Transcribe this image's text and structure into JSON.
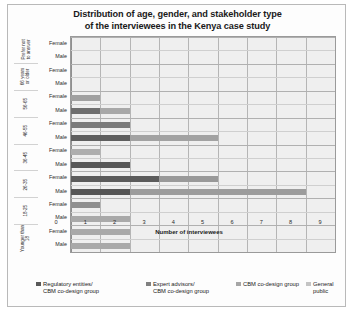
{
  "chart_data": {
    "type": "bar",
    "orientation": "horizontal",
    "stacked": true,
    "title": "Distribution of age, gender, and stakeholder type of the interviewees in the Kenya case study",
    "title_line1": "Distribution of age, gender, and stakeholder type",
    "title_line2": "of the interviewees in the Kenya case study",
    "xlabel": "Number of interviewees",
    "ylabel": "",
    "xlim": [
      0,
      9
    ],
    "xticks": [
      0,
      1,
      2,
      3,
      4,
      5,
      6,
      7,
      8,
      9
    ],
    "xtick_labels": [
      "0",
      "1",
      "2",
      "3",
      "4",
      "5",
      "6",
      "7",
      "8",
      "9"
    ],
    "grid": true,
    "legend_position": "bottom",
    "age_groups": [
      "Prefer not to answer",
      "66 years or older",
      "56-65",
      "46-55",
      "36-45",
      "26-35",
      "18-25",
      "Younger than 18"
    ],
    "genders": [
      "Female",
      "Male"
    ],
    "series": [
      {
        "name": "Regulatory entities/\nCBM co-design group",
        "color": "#595959",
        "values": [
          0,
          0,
          0,
          0,
          1,
          1,
          2,
          2,
          1,
          2,
          3,
          2,
          1,
          0,
          0,
          0
        ]
      },
      {
        "name": "Expert advisors/\nCBM co-design group",
        "color": "#a6a6a6",
        "values": [
          0,
          0,
          0,
          0,
          0,
          0,
          0,
          0,
          0,
          0,
          0,
          0,
          0,
          2,
          2,
          2
        ]
      },
      {
        "name": "CBM co-design group",
        "color": "#8c8c8c",
        "values": [
          0,
          0,
          0,
          0,
          0,
          0,
          0,
          3,
          2,
          6,
          0,
          0,
          0,
          0,
          0,
          0
        ]
      },
      {
        "name": "General public",
        "color": "#bfbfbf",
        "values": [
          0,
          0,
          0,
          0,
          0,
          0,
          0,
          0,
          0,
          0,
          0,
          0,
          0,
          0,
          0,
          0
        ]
      }
    ],
    "rows": [
      {
        "age": "Prefer not to answer",
        "gender": "Female",
        "segments": []
      },
      {
        "age": "Prefer not to answer",
        "gender": "Male",
        "segments": []
      },
      {
        "age": "66 years or older",
        "gender": "Female",
        "segments": []
      },
      {
        "age": "66 years or older",
        "gender": "Male",
        "segments": []
      },
      {
        "age": "56-65",
        "gender": "Female",
        "segments": [
          {
            "series": 0,
            "value": 1,
            "color": "#a0a0a0"
          }
        ]
      },
      {
        "age": "56-65",
        "gender": "Male",
        "segments": [
          {
            "series": 0,
            "value": 1,
            "color": "#6e6e6e"
          },
          {
            "series": 2,
            "value": 1,
            "color": "#a8a8a8"
          }
        ]
      },
      {
        "age": "46-55",
        "gender": "Female",
        "segments": [
          {
            "series": 0,
            "value": 2,
            "color": "#7a7a7a"
          }
        ]
      },
      {
        "age": "46-55",
        "gender": "Male",
        "segments": [
          {
            "series": 0,
            "value": 2,
            "color": "#5f5f5f"
          },
          {
            "series": 2,
            "value": 3,
            "color": "#a2a2a2"
          }
        ]
      },
      {
        "age": "36-45",
        "gender": "Female",
        "segments": [
          {
            "series": 0,
            "value": 1,
            "color": "#aeaeae"
          }
        ]
      },
      {
        "age": "36-45",
        "gender": "Male",
        "segments": [
          {
            "series": 0,
            "value": 2,
            "color": "#585858"
          }
        ]
      },
      {
        "age": "26-35",
        "gender": "Female",
        "segments": [
          {
            "series": 0,
            "value": 3,
            "color": "#5b5b5b"
          },
          {
            "series": 2,
            "value": 2,
            "color": "#999999"
          }
        ]
      },
      {
        "age": "26-35",
        "gender": "Male",
        "segments": [
          {
            "series": 0,
            "value": 2,
            "color": "#565656"
          },
          {
            "series": 2,
            "value": 6,
            "color": "#9c9c9c"
          }
        ]
      },
      {
        "age": "18-25",
        "gender": "Female",
        "segments": [
          {
            "series": 0,
            "value": 1,
            "color": "#8f8f8f"
          }
        ]
      },
      {
        "age": "18-25",
        "gender": "Male",
        "segments": [
          {
            "series": 1,
            "value": 2,
            "color": "#a9a9a9"
          }
        ]
      },
      {
        "age": "Younger than 18",
        "gender": "Female",
        "segments": [
          {
            "series": 1,
            "value": 2,
            "color": "#a9a9a9"
          }
        ]
      },
      {
        "age": "Younger than 18",
        "gender": "Male",
        "segments": [
          {
            "series": 1,
            "value": 2,
            "color": "#a9a9a9"
          }
        ]
      }
    ]
  },
  "legend": {
    "items": [
      {
        "label": "Regulatory entities/\nCBM co-design group",
        "color": "#595959"
      },
      {
        "label": "Expert advisors/\nCBM co-design group",
        "color": "#808080"
      },
      {
        "label": "CBM co-design group",
        "color": "#a6a6a6"
      },
      {
        "label": "General public",
        "color": "#c4c4c4"
      }
    ]
  }
}
